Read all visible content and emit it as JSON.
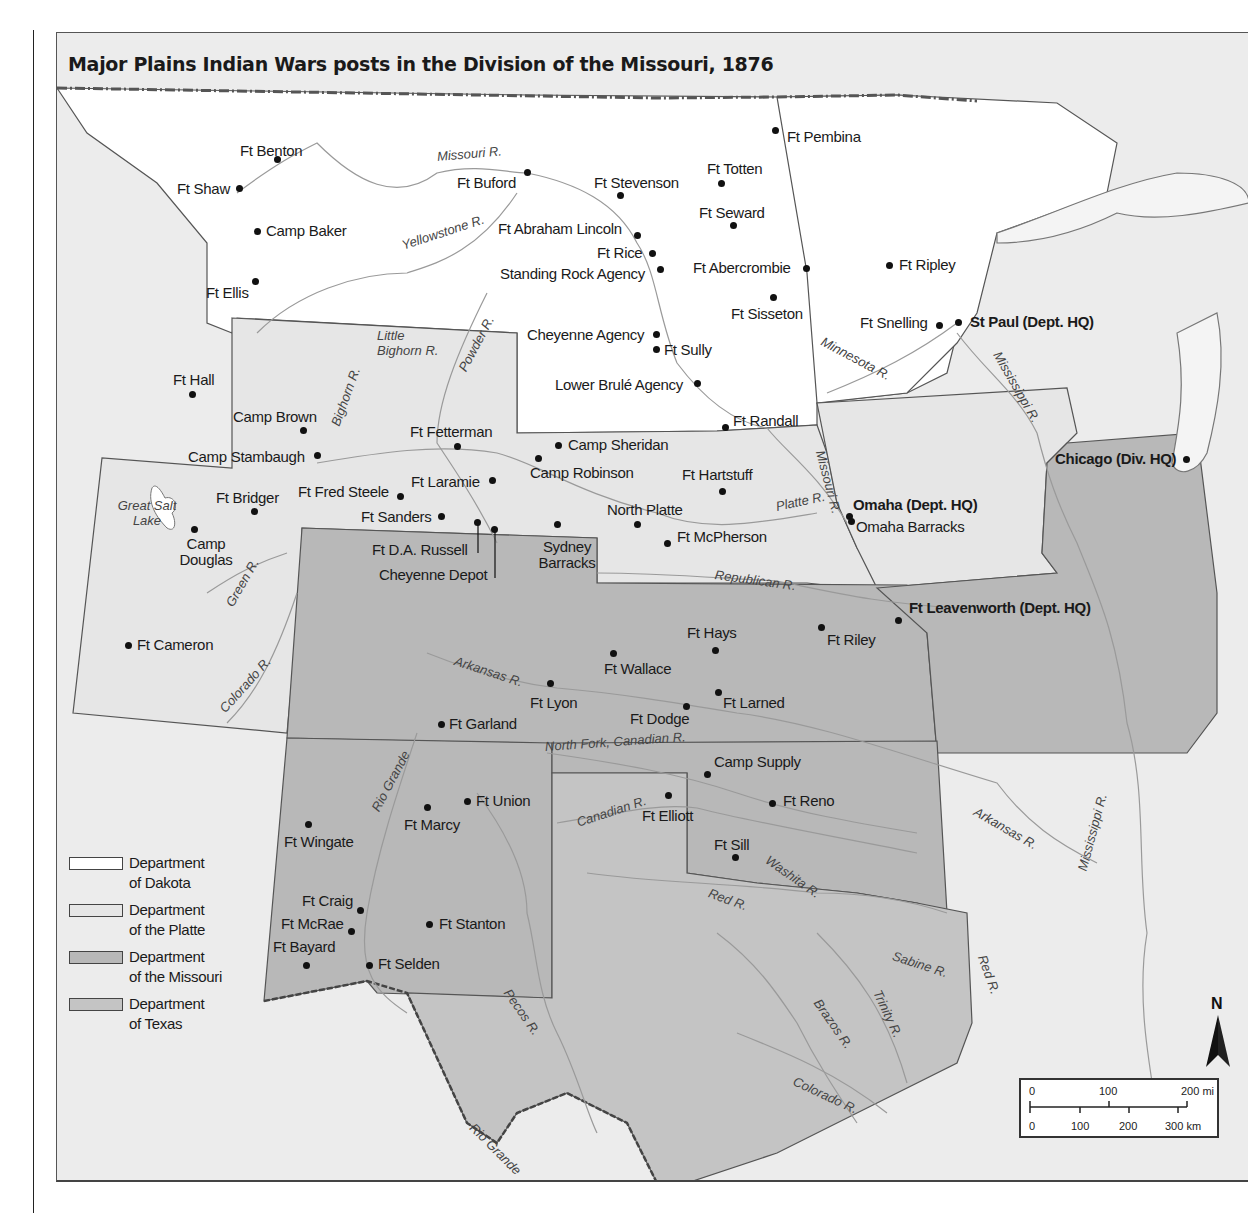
{
  "map": {
    "title": "Major Plains Indian Wars posts in the Division of the Missouri, 1876",
    "colors": {
      "dakota": "#ffffff",
      "platte": "#e6e6e6",
      "missouri": "#b8b8b8",
      "texas": "#c4c4c4",
      "background": "#ececec",
      "border": "#555555",
      "river": "#9a9a9a",
      "dot": "#111111"
    },
    "legend": [
      {
        "label_line1": "Department",
        "label_line2": "of Dakota",
        "color": "#ffffff"
      },
      {
        "label_line1": "Department",
        "label_line2": "of the Platte",
        "color": "#e6e6e6"
      },
      {
        "label_line1": "Department",
        "label_line2": "of the Missouri",
        "color": "#b8b8b8"
      },
      {
        "label_line1": "Department",
        "label_line2": "of Texas",
        "color": "#c4c4c4"
      }
    ],
    "posts": [
      {
        "name": "Ft Benton"
      },
      {
        "name": "Ft Shaw"
      },
      {
        "name": "Camp Baker"
      },
      {
        "name": "Ft Ellis"
      },
      {
        "name": "Ft Buford"
      },
      {
        "name": "Ft Stevenson"
      },
      {
        "name": "Ft Totten"
      },
      {
        "name": "Ft Pembina"
      },
      {
        "name": "Ft Seward"
      },
      {
        "name": "Ft Abraham Lincoln"
      },
      {
        "name": "Ft Rice"
      },
      {
        "name": "Standing Rock Agency"
      },
      {
        "name": "Ft Abercrombie"
      },
      {
        "name": "Ft Ripley"
      },
      {
        "name": "Ft Sisseton"
      },
      {
        "name": "Ft Snelling"
      },
      {
        "name": "St Paul (Dept. HQ)"
      },
      {
        "name": "Cheyenne Agency"
      },
      {
        "name": "Ft Sully"
      },
      {
        "name": "Lower Brulé Agency"
      },
      {
        "name": "Ft Randall"
      },
      {
        "name": "Ft Hall"
      },
      {
        "name": "Camp Brown"
      },
      {
        "name": "Camp Stambaugh"
      },
      {
        "name": "Ft Fetterman"
      },
      {
        "name": "Ft Laramie"
      },
      {
        "name": "Ft Bridger"
      },
      {
        "name": "Ft Fred Steele"
      },
      {
        "name": "Ft Sanders"
      },
      {
        "name": "Ft D.A. Russell"
      },
      {
        "name": "Cheyenne Depot"
      },
      {
        "name": "Camp Douglas"
      },
      {
        "name": "Camp Sheridan"
      },
      {
        "name": "Camp Robinson"
      },
      {
        "name": "Ft Hartstuff"
      },
      {
        "name": "North Platte"
      },
      {
        "name": "Ft McPherson"
      },
      {
        "name": "Sydney Barracks"
      },
      {
        "name": "Omaha (Dept. HQ)"
      },
      {
        "name": "Omaha Barracks"
      },
      {
        "name": "Chicago (Div. HQ)"
      },
      {
        "name": "Ft Cameron"
      },
      {
        "name": "Ft Leavenworth (Dept. HQ)"
      },
      {
        "name": "Ft Hays"
      },
      {
        "name": "Ft Riley"
      },
      {
        "name": "Ft Wallace"
      },
      {
        "name": "Ft Lyon"
      },
      {
        "name": "Ft Larned"
      },
      {
        "name": "Ft Dodge"
      },
      {
        "name": "Ft Garland"
      },
      {
        "name": "Camp Supply"
      },
      {
        "name": "Ft Union"
      },
      {
        "name": "Ft Reno"
      },
      {
        "name": "Ft Marcy"
      },
      {
        "name": "Ft Elliott"
      },
      {
        "name": "Ft Wingate"
      },
      {
        "name": "Ft Sill"
      },
      {
        "name": "Ft Craig"
      },
      {
        "name": "Ft McRae"
      },
      {
        "name": "Ft Stanton"
      },
      {
        "name": "Ft Bayard"
      },
      {
        "name": "Ft Selden"
      }
    ],
    "rivers": [
      "Missouri R.",
      "Yellowstone R.",
      "Little Bighorn R.",
      "Powder R.",
      "Bighorn R.",
      "Minnesota R.",
      "Mississippi R.",
      "Missouri R.",
      "Platte R.",
      "Great Salt Lake",
      "Green R.",
      "Colorado R.",
      "Republican R.",
      "Arkansas R.",
      "North Fork, Canadian R.",
      "Canadian R.",
      "Rio Grande",
      "Washita R.",
      "Red R.",
      "Arkansas R.",
      "Mississippi R.",
      "Sabine R.",
      "Red R.",
      "Brazos R.",
      "Trinity R.",
      "Pecos R.",
      "Colorado R.",
      "Rio Grande"
    ],
    "scale": {
      "mi_labels": [
        "0",
        "100",
        "200 mi"
      ],
      "km_labels": [
        "0",
        "100",
        "200",
        "300 km"
      ]
    },
    "north_label": "N"
  }
}
